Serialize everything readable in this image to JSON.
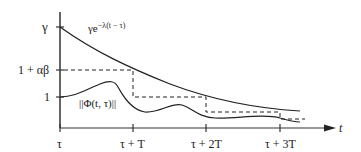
{
  "diagram": {
    "y_labels": {
      "gamma": "γ",
      "one_plus_alpha_beta": "1 + αβ",
      "one": "1"
    },
    "x_labels": [
      "τ",
      "τ + T",
      "τ + 2T",
      "τ + 3T"
    ],
    "x_axis_label": "t",
    "curve_labels": {
      "exponential_base": "γe",
      "exponential_exponent": "−λ(t − τ)",
      "norm": "||Φ(t, τ)||"
    },
    "colors": {
      "ink": "#222222",
      "axis": "#333333",
      "background": "#ffffff"
    }
  }
}
